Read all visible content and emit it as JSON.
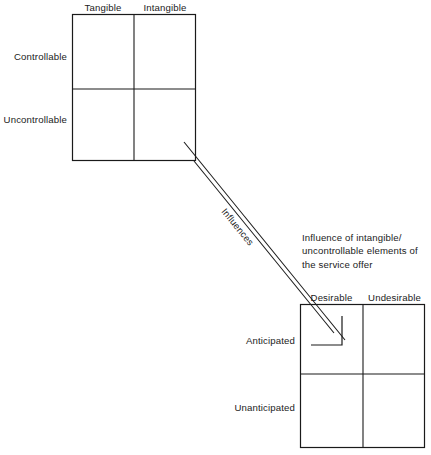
{
  "diagram": {
    "background_color": "#ffffff",
    "line_color": "#1a1a1a",
    "text_color": "#222222"
  },
  "matrix_top": {
    "name": "service-offer-matrix",
    "column_headers": [
      "Tangible",
      "Intangible"
    ],
    "row_labels": [
      "Controllable",
      "Uncontrollable"
    ],
    "cells": [
      [
        "",
        ""
      ],
      [
        "",
        ""
      ]
    ]
  },
  "matrix_bottom": {
    "name": "consumer-experience-matrix",
    "column_headers": [
      "Desirable",
      "Undesirable"
    ],
    "row_labels": [
      "Anticipated",
      "Unanticipated"
    ],
    "cells": [
      [
        "",
        ""
      ],
      [
        "",
        ""
      ]
    ]
  },
  "connector": {
    "label": "Influences",
    "annotation": "Influence of intangible/\nuncontrollable elements of\nthe service offer"
  }
}
